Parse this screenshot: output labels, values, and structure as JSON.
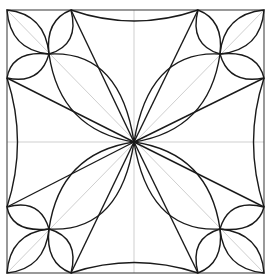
{
  "diagram": {
    "title": "",
    "colors": {
      "ink": "#1a1a1a",
      "guide": "#cfcfcf",
      "frame": "#555555",
      "background": "#ffffff"
    },
    "frame": {
      "x1": 7,
      "y1": 10,
      "x2": 264,
      "y2": 273
    },
    "center": {
      "x": 134,
      "y": 142
    },
    "corner_petal_size": 64
  }
}
